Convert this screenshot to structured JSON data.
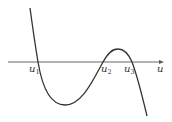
{
  "diagram": {
    "type": "function-graph",
    "axis": {
      "label": "u",
      "y": 62,
      "x_start": 8,
      "x_end": 163,
      "color": "#555555"
    },
    "curve": {
      "color": "#333333",
      "path": "M 30 8 C 33 30, 36 50, 38 62 C 41 80, 48 105, 65 105 C 82 105, 93 80, 103 62 C 108 53, 112 49, 118 49 C 124 49, 129 55, 132 62 C 137 75, 142 95, 147 116"
    },
    "roots": [
      {
        "name": "u",
        "sub": "1",
        "x": 38,
        "label_x": 29,
        "label_y": 72
      },
      {
        "name": "u",
        "sub": "2",
        "x": 103,
        "label_x": 101,
        "label_y": 72
      },
      {
        "name": "u",
        "sub": "3",
        "x": 132,
        "label_x": 124,
        "label_y": 72
      }
    ],
    "axis_label_pos": {
      "x": 157,
      "y": 72
    }
  }
}
